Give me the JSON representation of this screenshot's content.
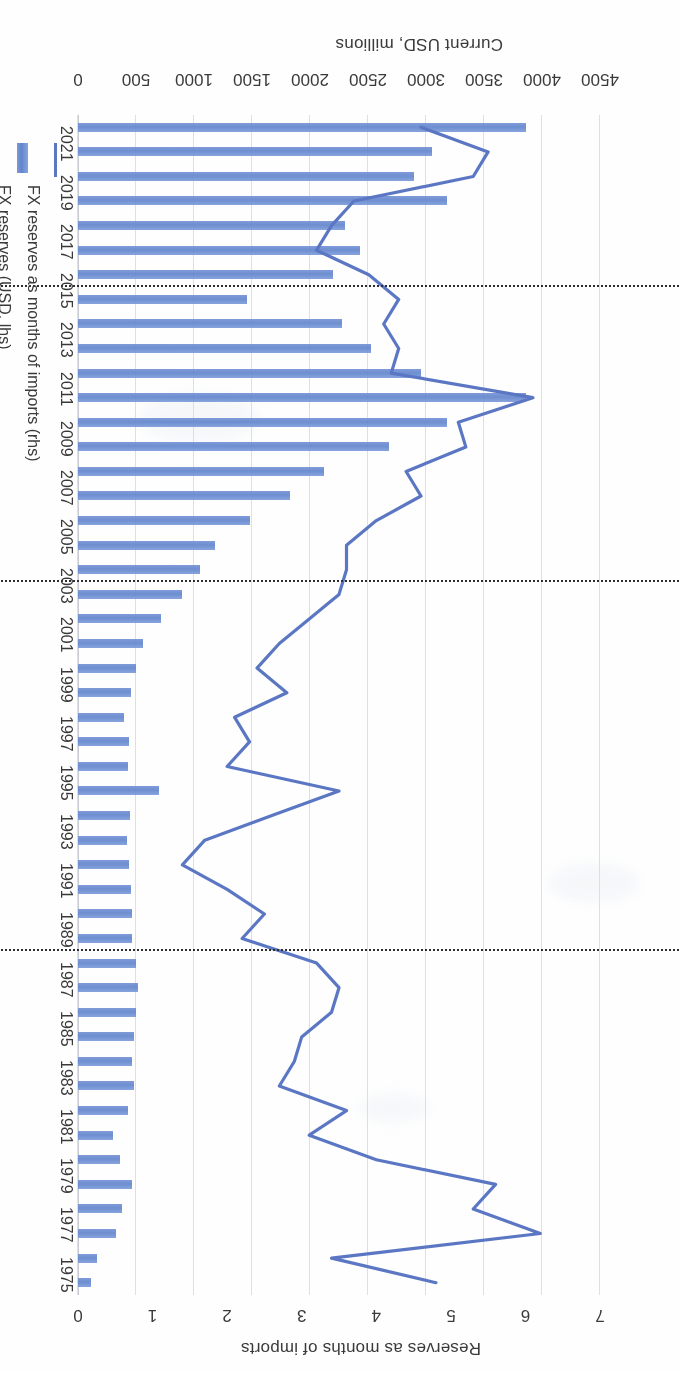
{
  "chart_data": {
    "type": "bar",
    "title": "",
    "subtitle": "",
    "orientation": "vertical-bars-with-overlaid-line",
    "xlabel": "",
    "ylabel": "Current USD, millions",
    "y2label": "Reserves as months of imports",
    "ylim": [
      0,
      4500
    ],
    "y2lim": [
      0,
      7
    ],
    "yticks": [
      "0",
      "500",
      "1000",
      "1500",
      "2000",
      "2500",
      "3000",
      "3500",
      "4000",
      "4500"
    ],
    "y2ticks": [
      "0",
      "1",
      "2",
      "3",
      "4",
      "5",
      "6",
      "7"
    ],
    "grid": "vertical gridlines on value axis",
    "legend_position": "bottom",
    "legend": [
      {
        "label": "FX reserves (USD, lhs)",
        "marker": "bar",
        "color": "#6c8fd4"
      },
      {
        "label": "FX reserves as months of imports (rhs)",
        "marker": "line",
        "color": "#5b77c4"
      }
    ],
    "categories": [
      "1975",
      "1976",
      "1977",
      "1978",
      "1979",
      "1980",
      "1981",
      "1982",
      "1983",
      "1984",
      "1985",
      "1986",
      "1987",
      "1988",
      "1989",
      "1990",
      "1991",
      "1992",
      "1993",
      "1994",
      "1995",
      "1996",
      "1997",
      "1998",
      "1999",
      "2000",
      "2001",
      "2002",
      "2003",
      "2004",
      "2005",
      "2006",
      "2007",
      "2008",
      "2009",
      "2010",
      "2011",
      "2012",
      "2013",
      "2014",
      "2015",
      "2016",
      "2017",
      "2018",
      "2019",
      "2020",
      "2021",
      "2022"
    ],
    "tick_labels_shown": [
      "1975",
      "1977",
      "1979",
      "1981",
      "1983",
      "1985",
      "1987",
      "1989",
      "1991",
      "1993",
      "1995",
      "1997",
      "1999",
      "2001",
      "2003",
      "2005",
      "2007",
      "2009",
      "2011",
      "2013",
      "2015",
      "2017",
      "2019",
      "2021"
    ],
    "series": [
      {
        "name": "FX reserves (USD, lhs)",
        "axis": "left",
        "unit": "USD millions",
        "type": "bar",
        "color": "#6c8fd4",
        "values": [
          110,
          160,
          330,
          380,
          470,
          360,
          300,
          430,
          480,
          470,
          480,
          500,
          520,
          500,
          470,
          470,
          460,
          440,
          420,
          450,
          700,
          430,
          440,
          400,
          460,
          500,
          560,
          720,
          900,
          1050,
          1180,
          1480,
          1830,
          2120,
          2680,
          3180,
          3860,
          2960,
          2530,
          2280,
          1460,
          2200,
          2430,
          2300,
          3180,
          2900,
          3050,
          3860
        ]
      },
      {
        "name": "FX reserves as months of imports (rhs)",
        "axis": "right",
        "unit": "months",
        "type": "line",
        "color": "#5b77c4",
        "values": [
          4.8,
          3.4,
          6.2,
          5.3,
          5.6,
          4.0,
          3.1,
          3.6,
          2.7,
          2.9,
          3.0,
          3.4,
          3.5,
          3.2,
          2.2,
          2.5,
          2.0,
          1.4,
          1.7,
          2.6,
          3.5,
          2.0,
          2.3,
          2.1,
          2.8,
          2.4,
          2.7,
          3.1,
          3.5,
          3.6,
          3.6,
          4.0,
          4.6,
          4.4,
          5.2,
          5.1,
          6.1,
          4.2,
          4.3,
          4.1,
          4.3,
          3.9,
          3.2,
          3.4,
          3.7,
          5.3,
          5.5,
          4.6
        ]
      }
    ],
    "marker_lines": [
      {
        "label": "",
        "after_category": "1988",
        "style": "dotted",
        "color": "#2e2e2e"
      },
      {
        "label": "",
        "after_category": "2003",
        "style": "dotted",
        "color": "#2e2e2e"
      },
      {
        "label": "",
        "after_category": "2015",
        "style": "dotted",
        "color": "#2e2e2e"
      }
    ]
  }
}
